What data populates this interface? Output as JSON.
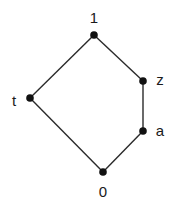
{
  "diagram": {
    "type": "hasse-diagram",
    "nodes": [
      {
        "id": "one",
        "label": "1",
        "x": 94,
        "y": 35,
        "lx": 94,
        "ly": 23
      },
      {
        "id": "z",
        "label": "z",
        "x": 143,
        "y": 81,
        "lx": 160,
        "ly": 85
      },
      {
        "id": "t",
        "label": "t",
        "x": 30,
        "y": 98,
        "lx": 14,
        "ly": 106
      },
      {
        "id": "a",
        "label": "a",
        "x": 143,
        "y": 131,
        "lx": 160,
        "ly": 136
      },
      {
        "id": "zero",
        "label": "0",
        "x": 103,
        "y": 172,
        "lx": 103,
        "ly": 197
      }
    ],
    "edges": [
      [
        "one",
        "z"
      ],
      [
        "one",
        "t"
      ],
      [
        "z",
        "a"
      ],
      [
        "a",
        "zero"
      ],
      [
        "t",
        "zero"
      ]
    ],
    "colors": {
      "line": "#2a2a2a",
      "node": "#111111"
    }
  }
}
